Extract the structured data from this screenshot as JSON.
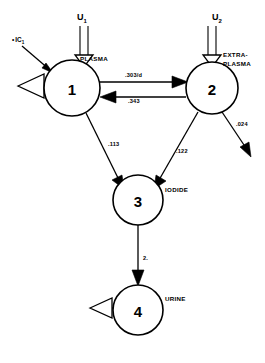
{
  "diagram": {
    "stroke_color": "#000000",
    "background_color": "#ffffff",
    "nodes": [
      {
        "id": "1",
        "number": "1",
        "label": "PLASMA",
        "cx": 72,
        "cy": 88,
        "r": 28
      },
      {
        "id": "2",
        "number": "2",
        "label": "EXTRA-",
        "label2": "PLASMA",
        "cx": 212,
        "cy": 88,
        "r": 26
      },
      {
        "id": "3",
        "number": "3",
        "label": "IODIDE",
        "cx": 138,
        "cy": 200,
        "r": 25
      },
      {
        "id": "4",
        "number": "4",
        "label": "URINE",
        "cx": 138,
        "cy": 310,
        "r": 25
      }
    ],
    "inputs": [
      {
        "name": "U1",
        "symbol": "U",
        "subscript": "1",
        "x": 84,
        "y": 16
      },
      {
        "name": "U2",
        "symbol": "U",
        "subscript": "2",
        "x": 219,
        "y": 16
      }
    ],
    "initial_condition": {
      "symbol": "IC",
      "subscript": "1",
      "marker": "•",
      "x": 14,
      "y": 40
    },
    "edges": [
      {
        "from": "1",
        "to": "2",
        "rate": ".303/d",
        "label_x": 125,
        "label_y": 77
      },
      {
        "from": "2",
        "to": "1",
        "rate": ".343",
        "label_x": 128,
        "label_y": 103
      },
      {
        "from": "1",
        "to": "3",
        "rate": ".113",
        "label_x": 108,
        "label_y": 146
      },
      {
        "from": "2",
        "to": "3",
        "rate": ".122",
        "label_x": 176,
        "label_y": 153
      },
      {
        "from": "2",
        "to": "out",
        "rate": ".024",
        "label_x": 236,
        "label_y": 126
      },
      {
        "from": "3",
        "to": "4",
        "rate": "2.",
        "label_x": 143,
        "label_y": 260
      }
    ],
    "samplers": [
      {
        "attached_to": "1",
        "name": "sampler-plasma"
      },
      {
        "attached_to": "4",
        "name": "sampler-urine"
      }
    ]
  }
}
